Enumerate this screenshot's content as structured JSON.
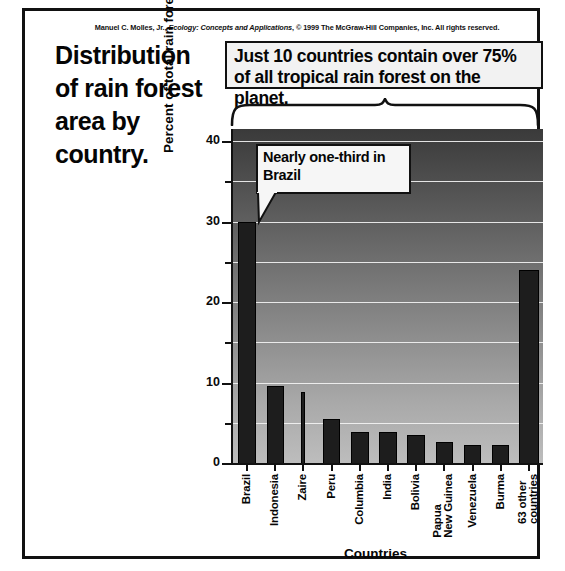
{
  "credit": {
    "author": "Manuel C. Molles, Jr., ",
    "work": "Ecology: Concepts and Applications",
    "rights": ", © 1999 The McGraw-Hill Companies, Inc. All rights reserved."
  },
  "title": "Distribution of rain forest area by country.",
  "callout_top": "Just 10 countries contain over 75% of all tropical rain forest on the planet.",
  "callout_brazil": "Nearly one-third in Brazil",
  "colors": {
    "bar": "#1d1d1d",
    "gridline": "#f2f2f2",
    "axis": "#111111",
    "plot_top": "#3a3a3a",
    "plot_bottom": "#bdbdbd",
    "callout_bg": "#f2f2f2",
    "text": "#050505"
  },
  "chart_data": {
    "type": "bar",
    "title": "Distribution of rain forest area by country.",
    "xlabel": "Countries",
    "ylabel": "Percent of total rain forest",
    "ylim": [
      0,
      41.5
    ],
    "yticks": [
      0,
      10,
      20,
      30,
      40
    ],
    "yminorticks": [
      5,
      15,
      25,
      35
    ],
    "grid": true,
    "legend": false,
    "categories": [
      "Brazil",
      "Indonesia",
      "Zaire",
      "Peru",
      "Columbia",
      "India",
      "Bolivia",
      "Papua\nNew Guinea",
      "Venezuela",
      "Burma",
      "63 other\ncountries"
    ],
    "values": [
      30,
      9.6,
      8.8,
      5.5,
      3.9,
      3.9,
      3.5,
      2.6,
      2.3,
      2.2,
      24
    ],
    "annotations": [
      "Just 10 countries contain over 75% of all tropical rain forest on the planet.",
      "Nearly one-third in Brazil"
    ]
  }
}
